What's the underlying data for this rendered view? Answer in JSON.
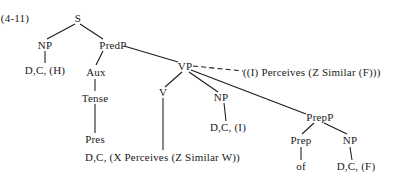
{
  "figure": {
    "number_label": "(4-11)",
    "type": "syntax-tree"
  },
  "nodes": {
    "s": "S",
    "np_subject": "NP",
    "dc_h": "D,C, (H)",
    "predp": "PredP",
    "aux": "Aux",
    "tense": "Tense",
    "pres": "Pres",
    "dc_x_perceives": "D,C, (X Perceives (Z Similar W))",
    "vp": "VP",
    "v": "V",
    "np_object": "NP",
    "dc_i": "D,C, (I)",
    "prepp": "PrepP",
    "prep": "Prep",
    "of": "of",
    "np_prep": "NP",
    "dc_f": "D,C, (F)",
    "semantic_gloss": "((I)  Perceives (Z Similar (F)))"
  },
  "colors": {
    "ink": "#1a1a1a",
    "background": "#ffffff"
  }
}
